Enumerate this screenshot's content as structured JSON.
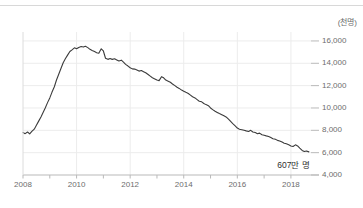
{
  "top_divider": {
    "ghost_text": ""
  },
  "chart_data": {
    "type": "line",
    "title": "",
    "subtitle": "",
    "unit_label": "(천명)",
    "xlabel": "",
    "ylabel": "",
    "grid": true,
    "legend_position": "none",
    "line_color": "#3b3b3b",
    "grid_color": "#ececec",
    "axis_color": "#b9b9b9",
    "tick_text_color": "#6d6d6d",
    "xlim": [
      2008.0,
      2018.75
    ],
    "ylim": [
      4000,
      16800
    ],
    "yticks": [
      4000,
      6000,
      8000,
      10000,
      12000,
      14000,
      16000
    ],
    "ytick_labels": [
      "4,000",
      "6,000",
      "8,000",
      "10,000",
      "12,000",
      "14,000",
      "16,000"
    ],
    "xticks": [
      2008,
      2010,
      2012,
      2014,
      2016,
      2018
    ],
    "xtick_labels": [
      "2008",
      "2010",
      "2012",
      "2014",
      "2016",
      "2018"
    ],
    "xminor_ticks": [
      2009,
      2011,
      2013,
      2015,
      2017
    ],
    "annotations": [
      {
        "text": "607만 명",
        "x": 2018.1,
        "y": 5000,
        "name": "end-value-annotation"
      }
    ],
    "series": [
      {
        "name": "인원",
        "x": [
          2008.0,
          2008.08,
          2008.17,
          2008.25,
          2008.33,
          2008.42,
          2008.5,
          2008.58,
          2008.67,
          2008.75,
          2008.83,
          2008.92,
          2009.0,
          2009.08,
          2009.17,
          2009.25,
          2009.33,
          2009.42,
          2009.5,
          2009.58,
          2009.67,
          2009.75,
          2009.83,
          2009.92,
          2010.0,
          2010.08,
          2010.17,
          2010.25,
          2010.33,
          2010.42,
          2010.5,
          2010.58,
          2010.67,
          2010.75,
          2010.83,
          2010.92,
          2011.0,
          2011.08,
          2011.17,
          2011.25,
          2011.33,
          2011.42,
          2011.5,
          2011.58,
          2011.67,
          2011.75,
          2011.83,
          2011.92,
          2012.0,
          2012.08,
          2012.17,
          2012.25,
          2012.33,
          2012.42,
          2012.5,
          2012.58,
          2012.67,
          2012.75,
          2012.83,
          2012.92,
          2013.0,
          2013.08,
          2013.17,
          2013.25,
          2013.33,
          2013.42,
          2013.5,
          2013.58,
          2013.67,
          2013.75,
          2013.83,
          2013.92,
          2014.0,
          2014.08,
          2014.17,
          2014.25,
          2014.33,
          2014.42,
          2014.5,
          2014.58,
          2014.67,
          2014.75,
          2014.83,
          2014.92,
          2015.0,
          2015.08,
          2015.17,
          2015.25,
          2015.33,
          2015.42,
          2015.5,
          2015.58,
          2015.67,
          2015.75,
          2015.83,
          2015.92,
          2016.0,
          2016.08,
          2016.17,
          2016.25,
          2016.33,
          2016.42,
          2016.5,
          2016.58,
          2016.67,
          2016.75,
          2016.83,
          2016.92,
          2017.0,
          2017.08,
          2017.17,
          2017.25,
          2017.33,
          2017.42,
          2017.5,
          2017.58,
          2017.67,
          2017.75,
          2017.83,
          2017.92,
          2018.0,
          2018.08,
          2018.17,
          2018.25,
          2018.33,
          2018.42,
          2018.5,
          2018.58,
          2018.67
        ],
        "values": [
          7800,
          7700,
          7850,
          7680,
          7900,
          8100,
          8450,
          8800,
          9200,
          9600,
          10000,
          10500,
          10900,
          11400,
          11900,
          12500,
          13000,
          13550,
          14050,
          14400,
          14750,
          15050,
          15200,
          15380,
          15300,
          15420,
          15500,
          15450,
          15520,
          15400,
          15250,
          15150,
          15050,
          14950,
          14900,
          15300,
          15100,
          14450,
          14350,
          14420,
          14350,
          14400,
          14300,
          14200,
          14280,
          14100,
          13900,
          13750,
          13600,
          13500,
          13480,
          13400,
          13300,
          13350,
          13250,
          13150,
          13000,
          12850,
          12700,
          12600,
          12500,
          12450,
          12800,
          12700,
          12500,
          12400,
          12300,
          12150,
          12000,
          11850,
          11750,
          11600,
          11500,
          11400,
          11300,
          11150,
          11000,
          10900,
          10750,
          10600,
          10550,
          10400,
          10300,
          10200,
          10000,
          9850,
          9700,
          9600,
          9500,
          9400,
          9300,
          9200,
          9000,
          8800,
          8600,
          8400,
          8200,
          8100,
          8050,
          8000,
          7950,
          7900,
          8000,
          7850,
          7800,
          7700,
          7750,
          7600,
          7550,
          7500,
          7450,
          7350,
          7250,
          7200,
          7100,
          7050,
          6950,
          6850,
          6800,
          6700,
          6600,
          6550,
          6700,
          6600,
          6400,
          6200,
          6100,
          6150,
          6070
        ]
      }
    ]
  }
}
